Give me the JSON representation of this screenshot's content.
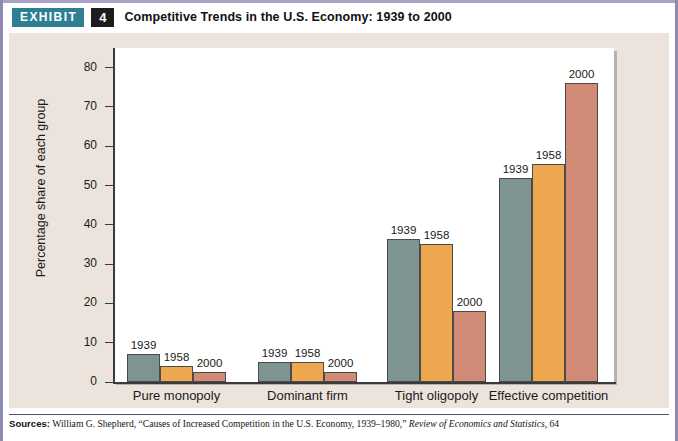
{
  "header": {
    "badge": "EXHIBIT",
    "number": "4",
    "title": "Competitive Trends in the U.S. Economy: 1939 to 2000"
  },
  "colors": {
    "badge_bg": "#2e7f92",
    "number_bg": "#1c1c1c",
    "panel_bg": "#ece4dc",
    "plot_bg": "#ffffff",
    "series_1939": "#7d9490",
    "series_1958": "#eda74e",
    "series_2000": "#d08a76",
    "frame": "#8d88b4"
  },
  "chart_data": {
    "type": "bar",
    "title": "Competitive Trends in the U.S. Economy: 1939 to 2000",
    "xlabel": "",
    "ylabel": "Percentage share of each group",
    "ylim": [
      0,
      85
    ],
    "yticks": [
      0,
      10,
      20,
      30,
      40,
      50,
      60,
      70,
      80
    ],
    "grid": false,
    "legend_position": "none",
    "bar_value_labels": true,
    "categories": [
      "Pure monopoly",
      "Dominant firm",
      "Tight oligopoly",
      "Effective competition"
    ],
    "series": [
      {
        "name": "1939",
        "color": "#7d9490",
        "values": [
          7,
          5,
          36.5,
          52
        ]
      },
      {
        "name": "1958",
        "color": "#eda74e",
        "values": [
          4,
          5,
          35,
          55.5
        ]
      },
      {
        "name": "2000",
        "color": "#d08a76",
        "values": [
          2.5,
          2.5,
          18,
          76
        ]
      }
    ],
    "point_labels": [
      [
        "1939",
        "1958",
        "2000"
      ],
      [
        "1939",
        "1958",
        "2000"
      ],
      [
        "1939",
        "1958",
        "2000"
      ],
      [
        "1939",
        "1958",
        "2000"
      ]
    ]
  },
  "source": {
    "label": "Sources:",
    "text_1": " William G. Shepherd, “Causes of Increased Competition in the U.S. Economy, 1939–1980,” ",
    "italic_1": "Review of Economics and Statistics,",
    "text_2": " 64"
  }
}
